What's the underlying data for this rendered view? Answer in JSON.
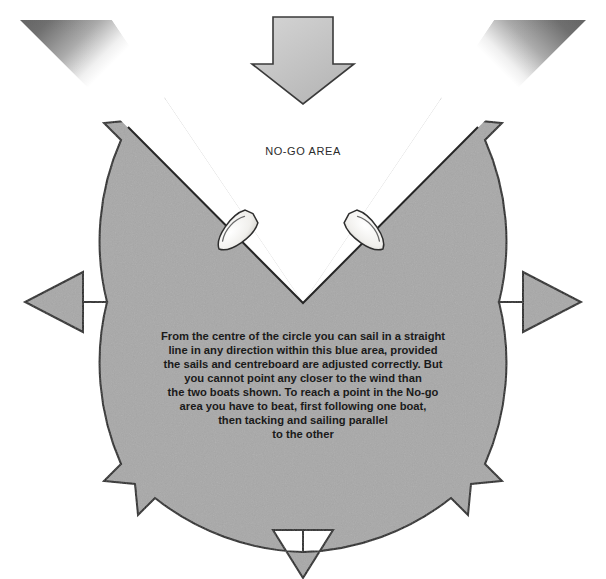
{
  "figure": {
    "background_color": "#ffffff",
    "circle_fill_color": "#a8a8a8",
    "outline_color": "#222222",
    "wedge_dark_color": "#6e6e6e",
    "wind_arrow_fill": "#c0c0c0",
    "boat_fill": "#f2f2f0"
  },
  "labels": {
    "no_go_area": "NO-GO AREA"
  },
  "body_text": {
    "lines": [
      "From the centre of the circle you can sail in a straight",
      "line in any direction within this blue area, provided",
      "the sails and centreboard are adjusted correctly. But",
      "you cannot point any closer to the wind than",
      "the two boats shown. To reach a point in the No-go",
      "area you have to beat, first following one boat,",
      "then tacking and sailing parallel",
      "to the other"
    ]
  },
  "geometry": {
    "center_x": 303,
    "center_y": 302,
    "radius": 250,
    "no_go_half_angle_deg": 45
  },
  "icons": {
    "wind_arrow": "arrow-down-icon",
    "direction_arrows": [
      "arrow-northeast-icon",
      "arrow-east-icon",
      "arrow-southeast-icon",
      "arrow-south-icon",
      "arrow-southwest-icon",
      "arrow-west-icon",
      "arrow-northwest-icon"
    ],
    "boats": [
      "boat-port-tack-icon",
      "boat-starboard-tack-icon"
    ]
  }
}
